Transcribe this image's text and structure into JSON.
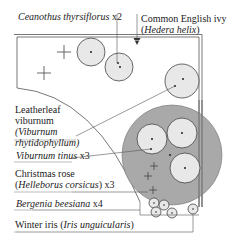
{
  "diagram": {
    "type": "garden planting plan",
    "colors": {
      "line": "#555555",
      "plant_fill": "#e8e8e8",
      "canopy_fill": "#a9a9a9",
      "text": "#222222"
    }
  },
  "labels": {
    "ceanothus": {
      "italic": "Ceanothus thyrsiflorus",
      "suffix": " x2"
    },
    "ivy": {
      "line1": "Common English ivy",
      "line2_open": "(",
      "line2_italic": "Hedera helix",
      "line2_close": ")"
    },
    "leatherleaf": {
      "line1": "Leatherleaf",
      "line2": "viburnum",
      "line3": "(Viburnum",
      "line4": "rhytidophyllum)"
    },
    "viburnum_tinus": {
      "italic": "Viburnum tinus",
      "suffix": " x3"
    },
    "christmas_rose": {
      "line1": "Christmas rose",
      "line2_open": "(",
      "line2_italic": "Helleborus corsicus",
      "line2_close": ") x3"
    },
    "bergenia": {
      "italic": "Bergenia beesiana",
      "suffix": " x4"
    },
    "winter_iris": {
      "plain": "Winter iris ",
      "open": "(",
      "italic": "Iris unguicularis",
      "close": ")"
    }
  }
}
